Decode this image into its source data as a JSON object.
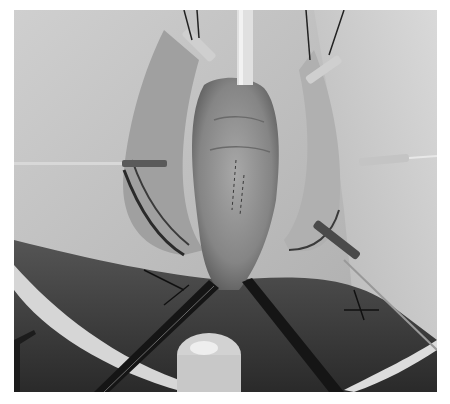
{
  "image": {
    "kind": "grayscale photograph",
    "alt": "Grayscale surgical photograph showing an exposed tubular tissue structure held open by retractors, sutures and instruments, with a tube entering from the top",
    "background_color": "#ffffff",
    "tones": {
      "drape": "#c8c8c8",
      "tissue": "#9a9a9a",
      "shadow": "#2a2a2a",
      "instrument": "#1a1a1a",
      "highlight": "#e6e6e6"
    }
  }
}
